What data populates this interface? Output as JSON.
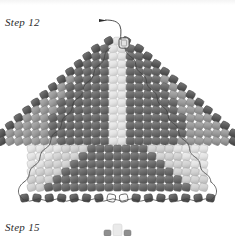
{
  "page": {
    "background": "#ffffff"
  },
  "labels": {
    "step_top": "Step 12",
    "step_bottom": "Step 15"
  },
  "palette": {
    "bead_dark": "#6d6d6d",
    "bead_dark_edge": "#4a4a4a",
    "bead_mid": "#9b9b9b",
    "bead_light": "#d4d4d4",
    "bead_pale": "#e8e8e8",
    "bead_white": "#fdfdfd",
    "bead_outline": "#555555",
    "thread": "#3a3a3a",
    "page_bg": "#ffffff",
    "text": "#2b2b2b"
  },
  "diagram": {
    "name": "peyote-triangle-beadwork",
    "shape": "triangle",
    "rows_upper": 14,
    "rows_lower": 7,
    "needle": {
      "name": "thread-with-needle",
      "arrow_label": "thread-direction-arrow",
      "arrow_x": 103,
      "arrow_y": 19,
      "enters_bead_x": 124,
      "enters_bead_y": 43
    },
    "apex_bead": {
      "name": "apex-open-bead",
      "x": 124,
      "y": 43,
      "fill": "#e2e2e2"
    },
    "open_beads_bottom": [
      {
        "name": "open-bead-left",
        "x": 108,
        "y": 205
      },
      {
        "name": "open-bead-right",
        "x": 126,
        "y": 205
      }
    ]
  },
  "bead_grid": {
    "legend": {
      "D": "dark bead",
      "E": "dark edge bead (outlined)",
      "M": "medium grey bead",
      "L": "light bead",
      "P": "pale bead",
      "W": "white open bead"
    },
    "upper_rows": [
      {
        "row": 1,
        "pattern": "E P E"
      },
      {
        "row": 2,
        "pattern": "E D P P D E"
      },
      {
        "row": 3,
        "pattern": "E D D P P D D E"
      },
      {
        "row": 4,
        "pattern": "E D D D P P D D D E"
      },
      {
        "row": 5,
        "pattern": "E D D D D P P D D D D E"
      },
      {
        "row": 6,
        "pattern": "E M D D D D P P D D D D M E"
      },
      {
        "row": 7,
        "pattern": "E M D D D D D P P D D D D D M E"
      },
      {
        "row": 8,
        "pattern": "E M M D D D D D P P D D D D D M M E"
      },
      {
        "row": 9,
        "pattern": "E M M D D D D D D P P D D D D D D M M E"
      },
      {
        "row": 10,
        "pattern": "E M M M D D D D D D P P D D D D D D M M M E"
      },
      {
        "row": 11,
        "pattern": "E M M M D D D D D D D P P D D D D D D D M M M E"
      },
      {
        "row": 12,
        "pattern": "E M M M M D D D D D D D P P D D D D D D D M M M M E"
      },
      {
        "row": 13,
        "pattern": "E M M M M M D D D D D D D P P D D D D D D D M M M M M E"
      },
      {
        "row": 14,
        "pattern": "E M M M M M M D D D D D D P P D D D D D D M M M M M M E"
      }
    ],
    "lower_rows": [
      {
        "row": 15,
        "pattern": "P P P P L L L D D D D D D D L L L P P P P"
      },
      {
        "row": 16,
        "pattern": "P P P L L L D D D D D D D D D L L L P P P"
      },
      {
        "row": 17,
        "pattern": "P P L L L D D D D D D D D D D D L L L P P"
      },
      {
        "row": 18,
        "pattern": "P L L L D D D D D D D D D D D D D L L L P"
      },
      {
        "row": 19,
        "pattern": "L L L D D D D D D D D D D D D D D D L L L"
      },
      {
        "row": 20,
        "pattern": "L L D D D D D D D D D D D D D D D D D L L"
      },
      {
        "row": 21,
        "pattern": "E E E E E E E W W E E E E E E E"
      }
    ]
  }
}
